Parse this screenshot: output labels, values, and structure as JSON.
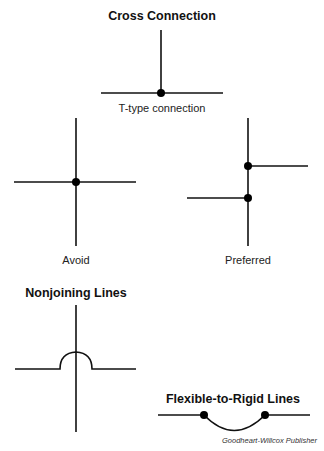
{
  "sections": {
    "cross_connection": {
      "title": "Cross Connection",
      "t_type": {
        "label": "T-type connection"
      },
      "avoid": {
        "label": "Avoid"
      },
      "preferred": {
        "label": "Preferred"
      }
    },
    "nonjoining": {
      "title": "Nonjoining Lines"
    },
    "flexible_to_rigid": {
      "title": "Flexible-to-Rigid Lines"
    }
  },
  "credit": "Goodheart-Willcox Publisher",
  "colors": {
    "line": "#111111",
    "dot": "#000000",
    "background": "#ffffff"
  }
}
